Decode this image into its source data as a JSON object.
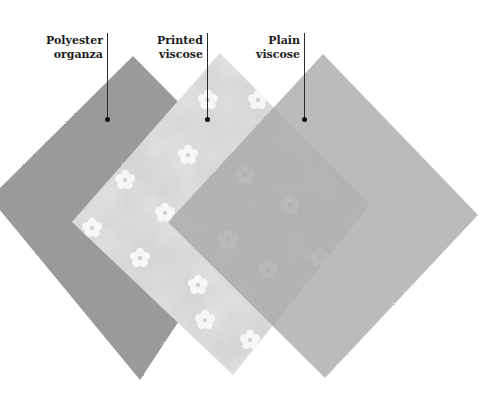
{
  "figure": {
    "type": "fabric swatch comparison",
    "background": "#ffffff"
  },
  "swatches": [
    {
      "id": "polyester-organza",
      "label_lines": [
        "Polyester",
        "organza"
      ],
      "color": "#9a9a9a",
      "pattern": "plain",
      "opacity": 1
    },
    {
      "id": "printed-viscose",
      "label_lines": [
        "Printed",
        "viscose"
      ],
      "color": "#d8d8d8",
      "pattern": "white flowers on mottled light ground",
      "opacity": 1
    },
    {
      "id": "plain-viscose",
      "label_lines": [
        "Plain",
        "viscose"
      ],
      "color": "#ababab",
      "pattern": "plain, semi-sheer",
      "opacity": 0.78
    }
  ]
}
